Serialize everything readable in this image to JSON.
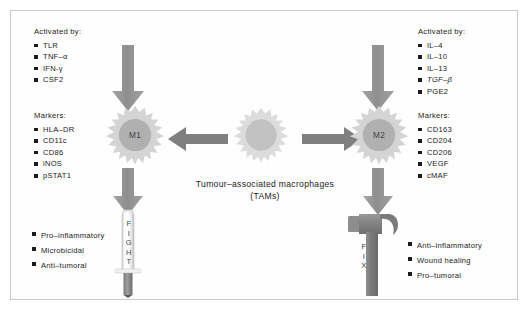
{
  "figure": {
    "background": "#ffffff",
    "border_color": "#c9c9c9"
  },
  "center": {
    "caption_line1": "Tumour–associated macrophages",
    "caption_line2": "(TAMs)",
    "cell_name": "tam-macrophage",
    "cell_label": ""
  },
  "left_branch": {
    "activated": {
      "title": "Activated by:",
      "items": [
        "TLR",
        "TNF–α",
        "IFN-γ",
        "CSF2"
      ]
    },
    "markers": {
      "title": "Markers:",
      "items": [
        "HLA–DR",
        "CD11c",
        "CD86",
        "iNOS",
        "pSTAT1"
      ]
    },
    "cell_label": "M1",
    "outcomes": [
      "Pro–inflammatory",
      "Microbicidal",
      "Anti–tumoral"
    ],
    "tool_word": "FIGHT",
    "tool_name": "syringe"
  },
  "right_branch": {
    "activated": {
      "title": "Activated by:",
      "items": [
        "IL–4",
        "IL–10",
        "IL–13",
        "TGF–β",
        "PGE2"
      ]
    },
    "markers": {
      "title": "Markers:",
      "items": [
        "CD163",
        "CD204",
        "CD206",
        "VEGF",
        "cMAF"
      ]
    },
    "cell_label": "M2",
    "outcomes": [
      "Anti–inflammatory",
      "Wound healing",
      "Pro–tumoral"
    ],
    "tool_word": "FIX",
    "tool_name": "hammer"
  },
  "colors": {
    "arrow": "#8a8a8a",
    "cell_body": "#d6d6d6",
    "cell_nucleus": "#b3b3b3",
    "center_cell_body": "#dedede",
    "text": "#1b1b1b"
  }
}
